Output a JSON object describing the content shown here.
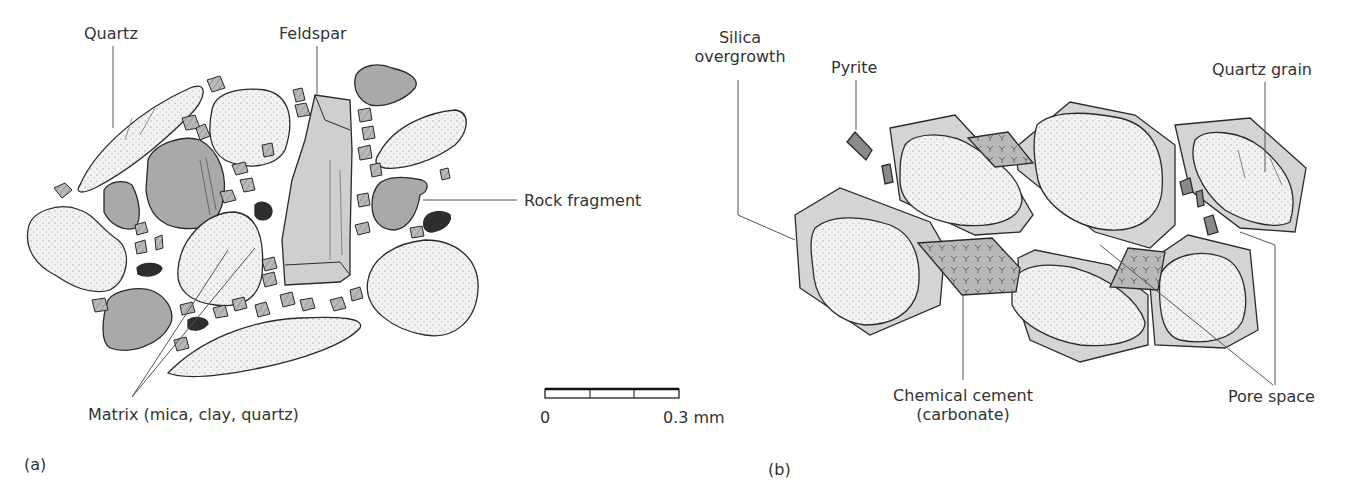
{
  "figure": {
    "panel_a": {
      "label": "(a)",
      "labels": {
        "quartz": "Quartz",
        "feldspar": "Feldspar",
        "rock_fragment": "Rock fragment",
        "matrix": "Matrix (mica, clay, quartz)"
      }
    },
    "scale_bar": {
      "start": "0",
      "end": "0.3 mm",
      "divisions": 3
    },
    "panel_b": {
      "label": "(b)",
      "labels": {
        "silica_line1": "Silica",
        "silica_line2": "overgrowth",
        "pyrite": "Pyrite",
        "quartz_grain": "Quartz grain",
        "chemical_cement_line1": "Chemical cement",
        "chemical_cement_line2": "(carbonate)",
        "pore_space": "Pore space"
      }
    },
    "colors": {
      "quartz_fill": "#f2f2f2",
      "rock_fragment_fill": "#a9a9a9",
      "feldspar_fill": "#cfcfcf",
      "matrix_fill": "#bdbdbd",
      "dark_mineral": "#2e2e2e",
      "overgrowth_fill": "#d4d4d4",
      "cement_fill": "#b8b8b8",
      "outline": "#2a2a2a",
      "leader_line": "#555555"
    }
  }
}
